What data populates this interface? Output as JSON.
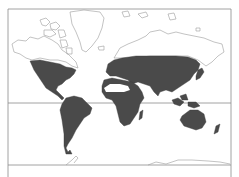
{
  "map": {
    "type": "world-distribution-map",
    "projection": "mercator",
    "colors": {
      "background": "#ffffff",
      "range_fill": "#4a4a4a",
      "land_outline": "#9a9a9a",
      "frame": "#8c8c8c",
      "equator": "#8c8c8c"
    },
    "equator_y": 103,
    "frame": {
      "left": 8,
      "top": 9,
      "right": 231,
      "bottom": 165
    },
    "shaded_regions": [
      "North America (USA, Mexico)",
      "Central America",
      "South America",
      "Europe",
      "North Africa (excluding Sahara)",
      "Sub-Saharan Africa",
      "Middle East",
      "Asia (Russia south, China, India, Southeast Asia)",
      "Japan",
      "Indonesia / New Guinea",
      "Australia",
      "New Zealand"
    ],
    "unshaded_regions": [
      "Canada / Arctic archipelago",
      "Greenland",
      "Arctic Russia / Siberia north",
      "Sahara desert",
      "Antarctica"
    ]
  }
}
